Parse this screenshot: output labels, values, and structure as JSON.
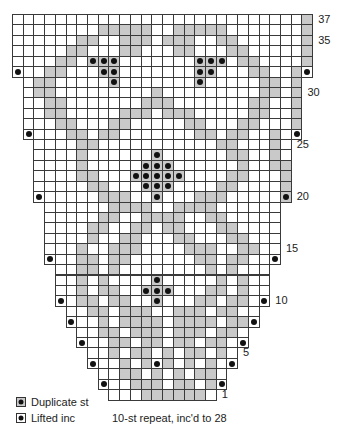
{
  "chart_data": {
    "type": "table",
    "rows_total": 37,
    "caption": "10-st repeat, inc'd to 28",
    "row_labels": [
      1,
      5,
      10,
      15,
      20,
      25,
      30,
      35,
      37
    ],
    "legend": [
      {
        "symbol": "shaded-square-with-dot",
        "label": "Duplicate st"
      },
      {
        "symbol": "dot",
        "label": "Lifted inc"
      }
    ],
    "colors": {
      "shade": "#c9c9c9",
      "grid": "#3a3a3a",
      "dot": "#111111"
    },
    "row_spans": {
      "1": [
        9,
        18
      ],
      "2": [
        8,
        19
      ],
      "3": [
        8,
        19
      ],
      "4": [
        7,
        20
      ],
      "5": [
        7,
        20
      ],
      "6": [
        6,
        21
      ],
      "7": [
        6,
        21
      ],
      "8": [
        5,
        22
      ],
      "9": [
        5,
        22
      ],
      "10": [
        4,
        23
      ],
      "11": [
        4,
        23
      ],
      "12": [
        4,
        23
      ],
      "13": [
        4,
        23
      ],
      "14": [
        3,
        24
      ],
      "15": [
        3,
        24
      ],
      "16": [
        3,
        24
      ],
      "17": [
        3,
        24
      ],
      "18": [
        3,
        24
      ],
      "19": [
        3,
        24
      ],
      "20": [
        2,
        25
      ],
      "21": [
        2,
        25
      ],
      "22": [
        2,
        25
      ],
      "23": [
        2,
        25
      ],
      "24": [
        2,
        25
      ],
      "25": [
        2,
        25
      ],
      "26": [
        1,
        26
      ],
      "27": [
        1,
        26
      ],
      "28": [
        1,
        26
      ],
      "29": [
        1,
        26
      ],
      "30": [
        1,
        26
      ],
      "31": [
        1,
        26
      ],
      "32": [
        0,
        27
      ],
      "33": [
        0,
        27
      ],
      "34": [
        0,
        27
      ],
      "35": [
        0,
        27
      ],
      "36": [
        0,
        27
      ],
      "37": [
        0,
        27
      ]
    },
    "shaded": {
      "1": [
        12,
        13,
        14,
        15,
        16,
        17
      ],
      "2": [
        11,
        12,
        13,
        15,
        16,
        18
      ],
      "3": [
        10,
        11,
        13,
        15,
        17,
        18
      ],
      "4": [
        10,
        12,
        14,
        16,
        18
      ],
      "5": [
        9,
        11,
        12,
        14,
        16,
        17,
        19
      ],
      "6": [
        9,
        10,
        12,
        13,
        15,
        16,
        18,
        19
      ],
      "7": [
        8,
        9,
        11,
        12,
        13,
        15,
        16,
        17,
        19,
        20
      ],
      "8": [
        8,
        10,
        11,
        12,
        13,
        15,
        16,
        17,
        18,
        20,
        21
      ],
      "9": [
        7,
        8,
        10,
        11,
        12,
        15,
        16,
        17,
        19,
        20
      ],
      "10": [
        6,
        7,
        9,
        10,
        13,
        17,
        18,
        20,
        21
      ],
      "11": [
        6,
        8,
        9,
        12,
        13,
        14,
        18,
        19,
        21
      ],
      "12": [
        6,
        8,
        13,
        19,
        21
      ],
      "13": [
        6,
        7,
        9,
        18,
        20
      ],
      "14": [
        6,
        7,
        9,
        10,
        17,
        18,
        20,
        21
      ],
      "15": [
        6,
        9,
        10,
        11,
        16,
        17,
        18,
        21,
        22
      ],
      "16": [
        7,
        10,
        11,
        15,
        16,
        20,
        21
      ],
      "17": [
        7,
        8,
        11,
        12,
        14,
        15,
        19,
        20
      ],
      "18": [
        8,
        9,
        12,
        13,
        14,
        15,
        18,
        19
      ],
      "19": [
        9,
        10,
        11,
        12,
        15,
        16,
        17,
        18
      ],
      "20": [
        8,
        9,
        10,
        13,
        17,
        18,
        19,
        25
      ],
      "21": [
        7,
        8,
        12,
        13,
        14,
        19,
        20,
        25
      ],
      "22": [
        6,
        7,
        11,
        12,
        13,
        14,
        15,
        20,
        21,
        25
      ],
      "23": [
        6,
        12,
        13,
        14,
        21,
        24,
        25
      ],
      "24": [
        6,
        13,
        20,
        21,
        24
      ],
      "25": [
        6,
        7,
        19,
        20,
        24
      ],
      "26": [
        5,
        6,
        8,
        9,
        17,
        18,
        20,
        21,
        24
      ],
      "27": [
        4,
        5,
        9,
        10,
        16,
        17,
        21,
        22,
        26
      ],
      "28": [
        3,
        4,
        10,
        11,
        12,
        14,
        15,
        16,
        22,
        23,
        26
      ],
      "29": [
        3,
        4,
        12,
        13,
        14,
        22,
        23,
        26
      ],
      "30": [
        2,
        3,
        13,
        23,
        24,
        26
      ],
      "31": [
        2,
        3,
        9,
        17,
        23,
        24,
        26
      ],
      "32": [
        3,
        4,
        17,
        22,
        23,
        26
      ],
      "33": [
        4,
        5,
        7,
        8,
        9,
        17,
        18,
        19,
        21,
        22,
        27
      ],
      "34": [
        5,
        6,
        10,
        11,
        15,
        16,
        20,
        21,
        27
      ],
      "35": [
        6,
        7,
        10,
        11,
        12,
        14,
        15,
        16,
        19,
        20,
        27
      ],
      "36": [
        8,
        9,
        10,
        11,
        12,
        15,
        16,
        17,
        18,
        19,
        27
      ],
      "37": [
        27
      ]
    },
    "duplicate_st": [
      [
        33,
        7
      ],
      [
        33,
        8
      ],
      [
        33,
        9
      ],
      [
        32,
        8
      ],
      [
        32,
        9
      ],
      [
        31,
        9
      ],
      [
        33,
        17
      ],
      [
        33,
        18
      ],
      [
        33,
        19
      ],
      [
        32,
        17
      ],
      [
        32,
        18
      ],
      [
        31,
        17
      ],
      [
        24,
        13
      ],
      [
        23,
        12
      ],
      [
        23,
        13
      ],
      [
        23,
        14
      ],
      [
        22,
        11
      ],
      [
        22,
        12
      ],
      [
        22,
        13
      ],
      [
        22,
        14
      ],
      [
        22,
        15
      ],
      [
        21,
        12
      ],
      [
        21,
        13
      ],
      [
        21,
        14
      ],
      [
        20,
        13
      ],
      [
        12,
        13
      ],
      [
        11,
        12
      ],
      [
        11,
        13
      ],
      [
        11,
        14
      ],
      [
        10,
        13
      ]
    ],
    "lifted_inc": [
      [
        2,
        8
      ],
      [
        2,
        19
      ],
      [
        4,
        7
      ],
      [
        4,
        20
      ],
      [
        6,
        6
      ],
      [
        6,
        21
      ],
      [
        8,
        5
      ],
      [
        8,
        22
      ],
      [
        10,
        4
      ],
      [
        10,
        23
      ],
      [
        14,
        3
      ],
      [
        14,
        24
      ],
      [
        20,
        2
      ],
      [
        20,
        25
      ],
      [
        26,
        1
      ],
      [
        26,
        26
      ],
      [
        32,
        0
      ],
      [
        32,
        27
      ],
      [
        4,
        13
      ]
    ]
  },
  "labels": {
    "legend_duplicate": "Duplicate st",
    "legend_lifted": "Lifted inc",
    "caption": "10-st repeat, inc'd to 28"
  }
}
